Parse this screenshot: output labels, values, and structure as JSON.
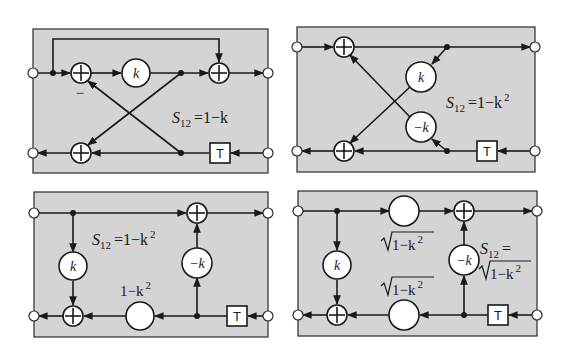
{
  "figure": {
    "panels": [
      {
        "id": "panel-1",
        "equation": {
          "lhs": "S",
          "sub": "12",
          "rhs": "=1−k"
        },
        "gains": [
          "k"
        ],
        "minus_sign": "−",
        "delay_label": "T"
      },
      {
        "id": "panel-2",
        "equation": {
          "lhs": "S",
          "sub": "12",
          "rhs": "=1−k",
          "sup": "2"
        },
        "gains": [
          "k",
          "−k"
        ],
        "delay_label": "T"
      },
      {
        "id": "panel-3",
        "equation": {
          "lhs": "S",
          "sub": "12",
          "rhs": "=1−k",
          "sup": "2"
        },
        "gains": [
          "k",
          "−k"
        ],
        "gain_label": {
          "text": "1−k",
          "sup": "2"
        },
        "delay_label": "T"
      },
      {
        "id": "panel-4",
        "equation": {
          "lhs": "S",
          "sub": "12",
          "rhs": "=",
          "line2": "1−k",
          "sup": "2"
        },
        "gains": [
          "k",
          "−k"
        ],
        "sqrt_label_top": {
          "text": "1−k",
          "sup": "2"
        },
        "sqrt_label_bottom": {
          "text": "1−k",
          "sup": "2"
        },
        "delay_label": "T"
      }
    ],
    "colors": {
      "panel_fill": "#d4d4d4",
      "line": "#1a1a1a",
      "background": "#ffffff"
    }
  }
}
